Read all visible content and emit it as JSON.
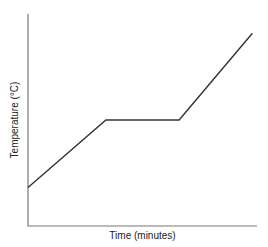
{
  "chart_data": {
    "type": "line",
    "title": "",
    "xlabel": "Time (minutes)",
    "ylabel": "Temperature (°C)",
    "grid": false,
    "legend": null,
    "x_ticks": [],
    "y_ticks": [],
    "series": [
      {
        "name": "Heating curve",
        "points": [
          {
            "x": 0,
            "y": 20
          },
          {
            "x": 34,
            "y": 55
          },
          {
            "x": 66,
            "y": 55
          },
          {
            "x": 98,
            "y": 100
          }
        ]
      }
    ],
    "xlim": [
      0,
      100
    ],
    "ylim": [
      0,
      110
    ],
    "annotations": []
  }
}
